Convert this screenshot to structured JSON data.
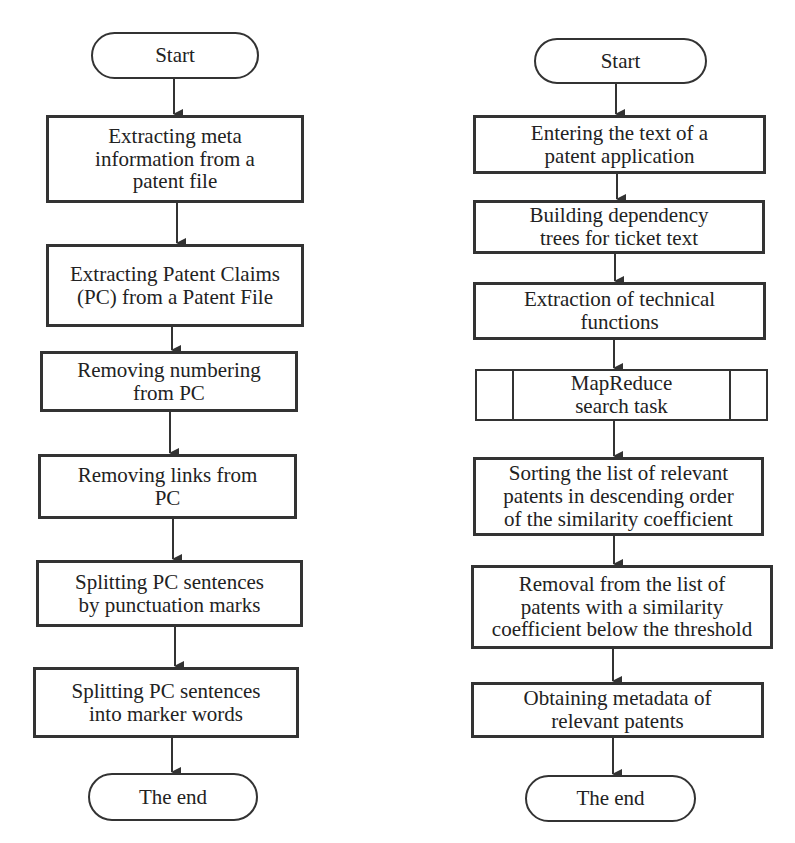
{
  "diagram": {
    "type": "flowchart",
    "flowcharts": [
      {
        "id": "left",
        "nodes": [
          {
            "id": "start",
            "shape": "terminal",
            "label": "Start"
          },
          {
            "id": "l1",
            "shape": "process",
            "label": "Extracting meta\ninformation from a\npatent file"
          },
          {
            "id": "l2",
            "shape": "process",
            "label": "Extracting Patent Claims\n(PC) from a Patent File"
          },
          {
            "id": "l3",
            "shape": "process",
            "label": "Removing numbering\nfrom PC"
          },
          {
            "id": "l4",
            "shape": "process",
            "label": "Removing links from\nPC"
          },
          {
            "id": "l5",
            "shape": "process",
            "label": "Splitting PC sentences\nby punctuation marks"
          },
          {
            "id": "l6",
            "shape": "process",
            "label": "Splitting PC sentences\ninto marker words"
          },
          {
            "id": "end",
            "shape": "terminal",
            "label": "The end"
          }
        ],
        "edges": [
          [
            "start",
            "l1"
          ],
          [
            "l1",
            "l2"
          ],
          [
            "l2",
            "l3"
          ],
          [
            "l3",
            "l4"
          ],
          [
            "l4",
            "l5"
          ],
          [
            "l5",
            "l6"
          ],
          [
            "l6",
            "end"
          ]
        ]
      },
      {
        "id": "right",
        "nodes": [
          {
            "id": "start",
            "shape": "terminal",
            "label": "Start"
          },
          {
            "id": "r1",
            "shape": "process",
            "label": "Entering the text of a\npatent application"
          },
          {
            "id": "r2",
            "shape": "process",
            "label": "Building dependency\ntrees for ticket text"
          },
          {
            "id": "r3",
            "shape": "process",
            "label": "Extraction of technical\nfunctions"
          },
          {
            "id": "r4",
            "shape": "predefined-process",
            "label": "MapReduce\nsearch task"
          },
          {
            "id": "r5",
            "shape": "process",
            "label": "Sorting the list of relevant\npatents in descending order\nof the similarity coefficient"
          },
          {
            "id": "r6",
            "shape": "process",
            "label": "Removal from the list of\npatents with a similarity\ncoefficient below the threshold"
          },
          {
            "id": "r7",
            "shape": "process",
            "label": "Obtaining metadata of\nrelevant patents"
          },
          {
            "id": "end",
            "shape": "terminal",
            "label": "The end"
          }
        ],
        "edges": [
          [
            "start",
            "r1"
          ],
          [
            "r1",
            "r2"
          ],
          [
            "r2",
            "r3"
          ],
          [
            "r3",
            "r4"
          ],
          [
            "r4",
            "r5"
          ],
          [
            "r5",
            "r6"
          ],
          [
            "r6",
            "r7"
          ],
          [
            "r7",
            "end"
          ]
        ]
      }
    ],
    "colors": {
      "stroke": "#333333",
      "fill": "#ffffff",
      "text": "#222222"
    }
  }
}
